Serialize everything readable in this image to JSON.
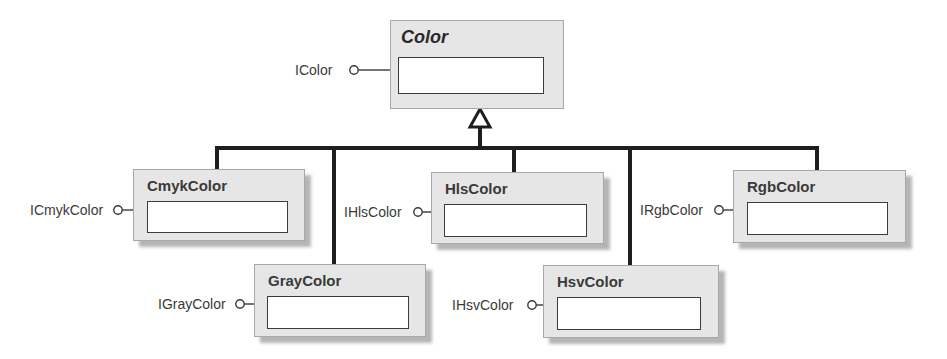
{
  "diagram": {
    "type": "uml-class-hierarchy",
    "base_class": {
      "name": "Color",
      "italic": true,
      "interface": "IColor"
    },
    "subclasses": [
      {
        "name": "CmykColor",
        "interface": "ICmykColor"
      },
      {
        "name": "GrayColor",
        "interface": "IGrayColor"
      },
      {
        "name": "HlsColor",
        "interface": "IHlsColor"
      },
      {
        "name": "HsvColor",
        "interface": "IHsvColor"
      },
      {
        "name": "RgbColor",
        "interface": "IRgbColor"
      }
    ],
    "relationship": "generalization",
    "colors": {
      "box_fill": "#e6e6e6",
      "box_border": "#a8a8a8",
      "inner_fill": "#ffffff",
      "line": "#1e1e1e"
    }
  }
}
